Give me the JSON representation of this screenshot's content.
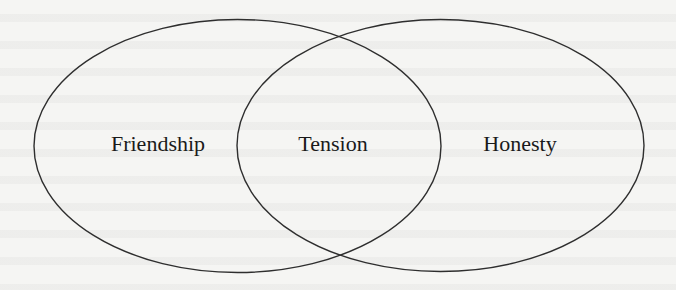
{
  "diagram": {
    "type": "venn",
    "sets": [
      {
        "id": "left",
        "label": "Friendship",
        "cx": 237.5,
        "cy": 146,
        "rx": 203.5,
        "ry": 126.5
      },
      {
        "id": "right",
        "label": "Honesty",
        "cx": 440.5,
        "cy": 145.5,
        "rx": 203.5,
        "ry": 126
      }
    ],
    "intersection": {
      "label": "Tension"
    },
    "label_positions": {
      "left": {
        "x": 158,
        "y": 151
      },
      "intersection": {
        "x": 333,
        "y": 151
      },
      "right": {
        "x": 520,
        "y": 151
      }
    },
    "colors": {
      "stroke": "#2e2e2e",
      "text": "#1a1a1a",
      "background": "#f5f5f3"
    }
  }
}
